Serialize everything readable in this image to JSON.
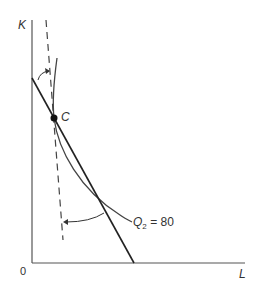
{
  "figure": {
    "type": "isoquant-isocost diagram",
    "axes": {
      "y_label": "K",
      "x_label": "L",
      "origin_label": "0"
    },
    "point": {
      "label": "C"
    },
    "isoquant": {
      "label_var": "Q",
      "label_sub": "2",
      "label_eq": " = 80"
    },
    "colors": {
      "line": "#222222",
      "axis": "#555555",
      "text": "#333333"
    }
  }
}
